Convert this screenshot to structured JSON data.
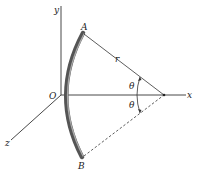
{
  "diagram": {
    "type": "geometry-3d-axes",
    "axes": {
      "x_label": "x",
      "y_label": "y",
      "z_label": "z",
      "origin_label": "O"
    },
    "points": {
      "A": "A",
      "B": "B"
    },
    "radius_label": "r",
    "angle_labels": [
      "θ",
      "θ"
    ],
    "colors": {
      "axis": "#333333",
      "arc_rod": "#555555",
      "arc_rod_highlight": "#999999",
      "text": "#222222"
    }
  }
}
